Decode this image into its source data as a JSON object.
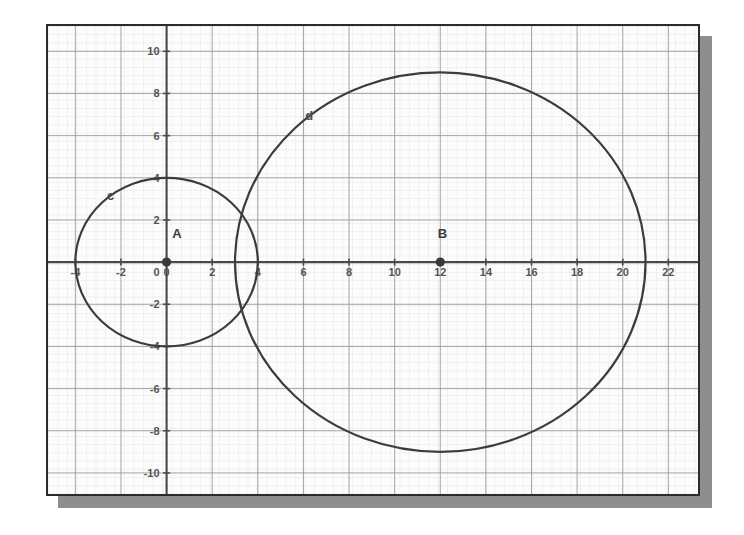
{
  "figure": {
    "title": "",
    "background_color": "#fcfcfc",
    "border_color": "#2b2b2b",
    "shadow_color": "#8e8e8e",
    "grid_minor_color": "#dcdcdc",
    "grid_major_color": "#9a9a9a",
    "axis_color": "#4a4a4a",
    "curve_color": "#3c3c3c"
  },
  "chart_data": {
    "type": "scatter",
    "title": "",
    "xlabel": "",
    "ylabel": "",
    "xlim": [
      -5.2,
      23.3
    ],
    "ylim": [
      -11.0,
      11.2
    ],
    "grid": true,
    "grid_minor_step": 0.4,
    "grid_major_step": 2,
    "legend": "none",
    "xticks": [
      -4,
      -2,
      0,
      2,
      4,
      6,
      8,
      10,
      12,
      14,
      16,
      18,
      20,
      22
    ],
    "xtick_labels": [
      "-4",
      "-2",
      "0",
      "2",
      "4",
      "6",
      "8",
      "10",
      "12",
      "14",
      "16",
      "18",
      "20",
      "22"
    ],
    "yticks": [
      -10,
      -8,
      -6,
      -4,
      -2,
      0,
      2,
      4,
      6,
      8,
      10
    ],
    "ytick_labels": [
      "-10",
      "-8",
      "-6",
      "-4",
      "-2",
      "0",
      "2",
      "4",
      "6",
      "8",
      "10"
    ],
    "circles": [
      {
        "name": "c",
        "label": "c",
        "center_x": 0,
        "center_y": 0,
        "radius": 4,
        "label_x": -2.45,
        "label_y": 2.95,
        "stroke": "#3c3c3c"
      },
      {
        "name": "d",
        "label": "d",
        "center_x": 12,
        "center_y": 0,
        "radius": 9,
        "label_x": 6.25,
        "label_y": 6.75,
        "stroke": "#3c3c3c"
      }
    ],
    "points": [
      {
        "name": "A",
        "label": "A",
        "x": 0,
        "y": 0,
        "label_x": 0.45,
        "label_y": 1.15,
        "color": "#3a3a3a"
      },
      {
        "name": "B",
        "label": "B",
        "x": 12,
        "y": 0,
        "label_x": 12.1,
        "label_y": 1.15,
        "color": "#3a3a3a"
      }
    ],
    "annotations": []
  }
}
